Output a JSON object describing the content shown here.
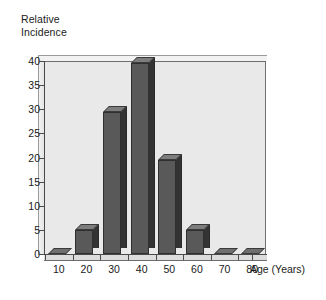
{
  "chart_data": {
    "type": "bar",
    "title": "",
    "ylabel": "Relative\nIncidence",
    "ylabel_line1": "Relative",
    "ylabel_line2": "Incidence",
    "xlabel": "Age (Years)",
    "categories": [
      "10",
      "20",
      "30",
      "40",
      "50",
      "60",
      "70",
      "80"
    ],
    "values": [
      0,
      5,
      29.5,
      39.5,
      19.5,
      5,
      0,
      0
    ],
    "ylim": [
      0,
      40
    ],
    "ytick_labels": [
      "0",
      "5",
      "10",
      "15",
      "20",
      "25",
      "30",
      "35",
      "40"
    ],
    "ytick_values": [
      0,
      5,
      10,
      15,
      20,
      25,
      30,
      35,
      40
    ],
    "grid": false,
    "legend": "none",
    "style": "3d-bar"
  },
  "colors": {
    "plot_background": "#e9e9e9",
    "bar_front": "#595959",
    "bar_side": "#333333",
    "bar_top": "#7d7d7d",
    "axis": "#4a4a4a",
    "text": "#1a1a1a",
    "page_background": "#ffffff"
  }
}
